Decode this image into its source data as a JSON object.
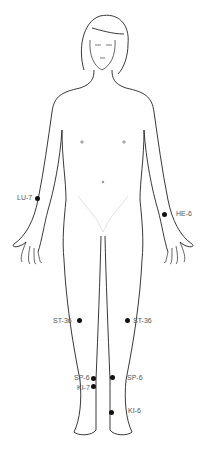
{
  "diagram": {
    "point_color": "#111111",
    "label_color": "#555555",
    "points": [
      {
        "label": "LU-7",
        "x": 37,
        "y": 198,
        "label_x": 17,
        "label_y": 194
      },
      {
        "label": "HE-6",
        "x": 164,
        "y": 214,
        "label_x": 176,
        "label_y": 210
      },
      {
        "label": "ST-36",
        "x": 79,
        "y": 320,
        "label_x": 53,
        "label_y": 317
      },
      {
        "label": "ST-36",
        "x": 127,
        "y": 320,
        "label_x": 133,
        "label_y": 317
      },
      {
        "label": "SP-6",
        "x": 93,
        "y": 378,
        "label_x": 74,
        "label_y": 374
      },
      {
        "label": "KI-7",
        "x": 93,
        "y": 386,
        "label_x": 77,
        "label_y": 384
      },
      {
        "label": "SP-6",
        "x": 112,
        "y": 377,
        "label_x": 127,
        "label_y": 374
      },
      {
        "label": "KI-6",
        "x": 111,
        "y": 412,
        "label_x": 128,
        "label_y": 407
      }
    ]
  }
}
